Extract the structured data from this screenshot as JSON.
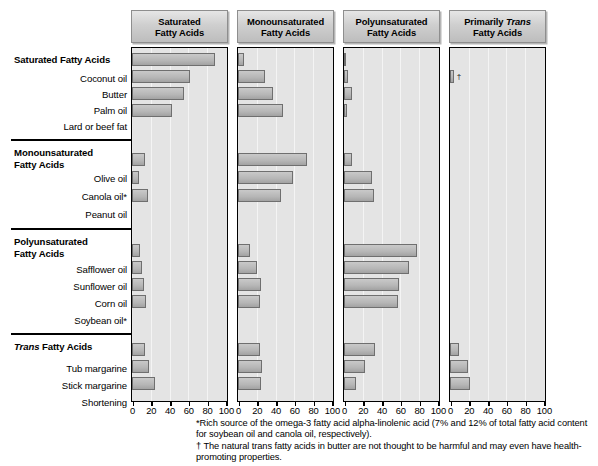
{
  "figure": {
    "axis_unit": "percent of total fatty acids"
  },
  "groups": [
    {
      "id": "saturated",
      "heading": "Saturated Fatty Acids",
      "heading_italic_word": ""
    },
    {
      "id": "monounsaturated",
      "heading": "Monounsaturated\nFatty Acids",
      "heading_italic_word": ""
    },
    {
      "id": "polyunsaturated",
      "heading": "Polyunsaturated\nFatty Acids",
      "heading_italic_word": ""
    },
    {
      "id": "trans",
      "heading": "Trans Fatty Acids",
      "heading_italic_word": "Trans"
    }
  ],
  "row_labels": [
    "Coconut oil",
    "Butter",
    "Palm oil",
    "Lard or beef fat",
    "Olive oil",
    "Canola oil*",
    "Peanut oil",
    "Safflower oil",
    "Sunflower oil",
    "Corn oil",
    "Soybean oil*",
    "Tub margarine",
    "Stick margarine",
    "Shortening"
  ],
  "panels": [
    {
      "id": "panel-saturated",
      "title_line1": "Saturated",
      "title_line2": "Fatty Acids",
      "title_italic": ""
    },
    {
      "id": "panel-monounsaturated",
      "title_line1": "Monounsaturated",
      "title_line2": "Fatty Acids",
      "title_italic": ""
    },
    {
      "id": "panel-polyunsaturated",
      "title_line1": "Polyunsaturated",
      "title_line2": "Fatty Acids",
      "title_italic": ""
    },
    {
      "id": "panel-trans",
      "title_line1": "Primarily Trans",
      "title_line2": "Fatty Acids",
      "title_italic": "Trans"
    }
  ],
  "axis": {
    "ticks": [
      0,
      20,
      40,
      60,
      80,
      100
    ],
    "min": 0,
    "max": 100
  },
  "markers": {
    "dagger": "†",
    "asterisk": "*"
  },
  "footnotes": [
    "*Rich source of the omega-3 fatty acid alpha-linolenic acid (7% and 12% of total fatty acid content for soybean oil and canola oil, respectively).",
    "† The natural trans fatty acids in butter are not thought to be harmful and may even have health-promoting properties."
  ],
  "colors": {
    "bar_fill": "#b6b6b6",
    "bar_stroke": "#6f6f6f",
    "plot_bg": "#e4e4e4",
    "title_bg": "#cfcfcf",
    "axis_line": "#000000",
    "gridline": "#f4f4f4"
  },
  "chart_data": {
    "type": "bar",
    "xlabel": "Percent of total fatty acids",
    "ylabel": "",
    "xlim": [
      0,
      100
    ],
    "xticks": [
      0,
      20,
      40,
      60,
      80,
      100
    ],
    "grid": true,
    "legend": "none",
    "orientation": "horizontal",
    "panels": [
      "Saturated Fatty Acids",
      "Monounsaturated Fatty Acids",
      "Polyunsaturated Fatty Acids",
      "Primarily Trans Fatty Acids"
    ],
    "categories": [
      "Coconut oil",
      "Butter",
      "Palm oil",
      "Lard or beef fat",
      "Olive oil",
      "Canola oil*",
      "Peanut oil",
      "Safflower oil",
      "Sunflower oil",
      "Corn oil",
      "Soybean oil*",
      "Tub margarine",
      "Stick margarine",
      "Shortening"
    ],
    "series": [
      {
        "name": "Saturated Fatty Acids",
        "values": [
          89,
          62,
          55,
          43,
          14,
          7,
          17,
          9,
          11,
          13,
          15,
          14,
          18,
          25
        ]
      },
      {
        "name": "Monounsaturated Fatty Acids",
        "values": [
          6,
          29,
          37,
          48,
          74,
          59,
          46,
          13,
          20,
          24,
          23,
          23,
          26,
          24
        ]
      },
      {
        "name": "Polyunsaturated Fatty Acids",
        "values": [
          2,
          4,
          9,
          3,
          8,
          30,
          32,
          78,
          69,
          59,
          58,
          33,
          22,
          13
        ]
      },
      {
        "name": "Primarily Trans Fatty Acids",
        "values": [
          0,
          4,
          0,
          0,
          0,
          0,
          0,
          0,
          0,
          0,
          0,
          10,
          19,
          21
        ]
      }
    ],
    "annotations": [
      {
        "panel": "Primarily Trans Fatty Acids",
        "category": "Butter",
        "text": "†"
      }
    ]
  }
}
